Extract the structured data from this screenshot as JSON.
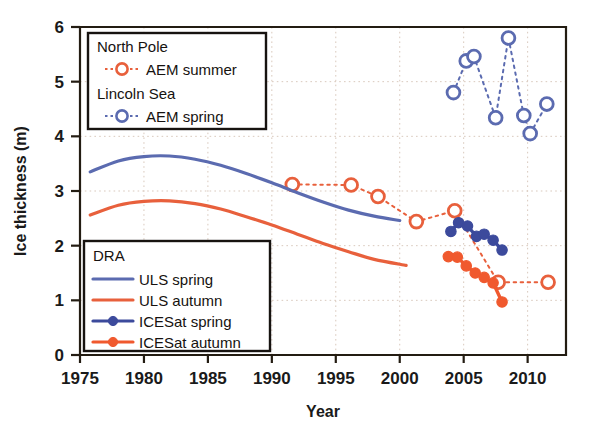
{
  "chart_data": {
    "type": "line",
    "title": "",
    "xlabel": "Year",
    "ylabel": "Ice thickness (m)",
    "xlim": [
      1975,
      2013
    ],
    "ylim": [
      0,
      6
    ],
    "xticks": [
      1975,
      1980,
      1985,
      1990,
      1995,
      2000,
      2005,
      2010
    ],
    "yticks": [
      0,
      1,
      2,
      3,
      4,
      5,
      6
    ],
    "xticklabels": [
      "1975",
      "1980",
      "1985",
      "1990",
      "1995",
      "2000",
      "2005",
      "2010"
    ],
    "yticklabels": [
      "0",
      "1",
      "2",
      "3",
      "4",
      "5",
      "6"
    ],
    "grid": true,
    "grid_style": "dotted",
    "legend_position": "upper-left and lower-left (two boxes inside axes)",
    "colors": {
      "aem_summer": "#e8603c",
      "aem_spring": "#5b6bb0",
      "uls_spring": "#5b6bb0",
      "uls_autumn": "#e8603c",
      "icesat_spring": "#3c4a9c",
      "icesat_autumn": "#f0592e",
      "axis": "#231c12",
      "grid": "#d9c9bd"
    },
    "series": [
      {
        "name": "AEM summer",
        "group": "North Pole",
        "marker": "open-circle",
        "color": "#e8603c",
        "linestyle": "dashed",
        "x": [
          1991.6,
          1996.2,
          1998.3,
          2001.3,
          2004.3,
          2007.7,
          2011.6
        ],
        "y": [
          3.12,
          3.11,
          2.9,
          2.44,
          2.64,
          1.33,
          1.33
        ]
      },
      {
        "name": "AEM spring",
        "group": "Lincoln Sea",
        "marker": "open-circle",
        "color": "#5b6bb0",
        "linestyle": "dashed",
        "x": [
          2004.2,
          2005.2,
          2005.8,
          2007.5,
          2008.5,
          2009.7,
          2010.2,
          2011.5
        ],
        "y": [
          4.8,
          5.38,
          5.46,
          4.34,
          5.8,
          4.38,
          4.05,
          4.59
        ]
      },
      {
        "name": "ULS spring",
        "group": "DRA",
        "marker": "none",
        "color": "#5b6bb0",
        "linestyle": "solid",
        "x": [
          1975.8,
          1978,
          1980,
          1982,
          1984,
          1986,
          1988,
          1990,
          1992,
          1994,
          1996,
          1998,
          2000
        ],
        "y": [
          3.35,
          3.55,
          3.63,
          3.64,
          3.58,
          3.47,
          3.32,
          3.15,
          2.97,
          2.8,
          2.65,
          2.54,
          2.46
        ]
      },
      {
        "name": "ULS autumn",
        "group": "DRA",
        "marker": "none",
        "color": "#e8603c",
        "linestyle": "solid",
        "x": [
          1975.8,
          1978,
          1980,
          1982,
          1984,
          1986,
          1988,
          1990,
          1992,
          1994,
          1996,
          1998,
          2000.5
        ],
        "y": [
          2.56,
          2.74,
          2.81,
          2.82,
          2.77,
          2.67,
          2.53,
          2.38,
          2.21,
          2.04,
          1.89,
          1.75,
          1.64
        ]
      },
      {
        "name": "ICESat spring",
        "group": "DRA",
        "marker": "filled-circle",
        "color": "#3c4a9c",
        "linestyle": "solid",
        "x": [
          2004.0,
          2004.6,
          2005.3,
          2006.0,
          2006.6,
          2007.3,
          2008.0
        ],
        "y": [
          2.26,
          2.42,
          2.36,
          2.17,
          2.21,
          2.1,
          1.92
        ]
      },
      {
        "name": "ICESat autumn",
        "group": "DRA",
        "marker": "filled-circle",
        "color": "#f0592e",
        "linestyle": "solid",
        "x": [
          2003.8,
          2004.5,
          2005.2,
          2005.9,
          2006.6,
          2007.3,
          2008.0
        ],
        "y": [
          1.8,
          1.79,
          1.63,
          1.5,
          1.42,
          1.32,
          0.97
        ]
      }
    ]
  },
  "legend_top": {
    "group1_title": "North Pole",
    "group1_item": "AEM summer",
    "group2_title": "Lincoln Sea",
    "group2_item": "AEM spring"
  },
  "legend_bottom": {
    "title": "DRA",
    "items": [
      "ULS spring",
      "ULS autumn",
      "ICESat spring",
      "ICESat autumn"
    ]
  }
}
